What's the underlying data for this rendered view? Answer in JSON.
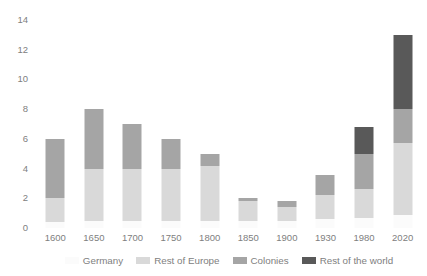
{
  "chart_data": {
    "type": "bar",
    "subtype": "stacked-bar",
    "title": "",
    "xlabel": "",
    "ylabel": "",
    "ylim": [
      0,
      14
    ],
    "ytick_step": 2,
    "yticks": [
      "14",
      "12",
      "10",
      "8",
      "6",
      "4",
      "2",
      "0"
    ],
    "grid": false,
    "legend_position": "bottom",
    "categories": [
      "1600",
      "1650",
      "1700",
      "1750",
      "1800",
      "1850",
      "1900",
      "1930",
      "1980",
      "2020"
    ],
    "series": [
      {
        "name": "Germany",
        "color": "#fbfbfb",
        "values": [
          0.4,
          0.5,
          0.5,
          0.5,
          0.5,
          0.5,
          0.5,
          0.6,
          0.7,
          0.9
        ]
      },
      {
        "name": "Rest of Europe",
        "color": "#d9d9d9",
        "values": [
          1.6,
          3.5,
          3.5,
          3.5,
          3.7,
          1.3,
          0.9,
          1.6,
          1.9,
          4.8
        ]
      },
      {
        "name": "Colonies",
        "color": "#a5a5a5",
        "values": [
          4.0,
          4.0,
          3.0,
          2.0,
          0.8,
          0.2,
          0.4,
          1.4,
          2.4,
          2.3
        ]
      },
      {
        "name": "Rest of the world",
        "color": "#595959",
        "values": [
          0,
          0,
          0,
          0,
          0,
          0,
          0,
          0,
          1.8,
          5.0
        ]
      }
    ],
    "totals": [
      6.0,
      8.0,
      7.0,
      6.0,
      5.0,
      2.0,
      1.8,
      3.6,
      6.8,
      13.0
    ]
  },
  "legend": {
    "entries": [
      {
        "label": "Germany",
        "color": "#fbfbfb"
      },
      {
        "label": "Rest of Europe",
        "color": "#d9d9d9"
      },
      {
        "label": "Colonies",
        "color": "#a5a5a5"
      },
      {
        "label": "Rest of the world",
        "color": "#595959"
      }
    ]
  }
}
